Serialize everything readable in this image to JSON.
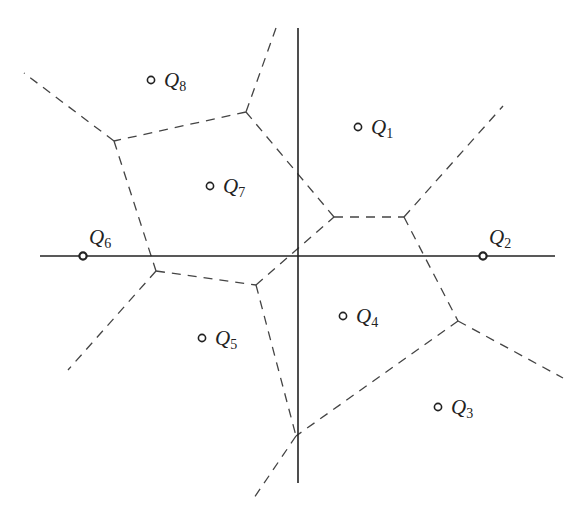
{
  "diagram": {
    "type": "voronoi",
    "axes": {
      "horizontal": {
        "x1": 40,
        "x2": 555,
        "y": 256
      },
      "vertical": {
        "x": 298,
        "y1": 28,
        "y2": 483
      }
    },
    "sites": [
      {
        "id": "Q1",
        "letter": "Q",
        "index": "1",
        "x": 358,
        "y": 127,
        "lx": 371,
        "ly": 134,
        "on_axis": false
      },
      {
        "id": "Q2",
        "letter": "Q",
        "index": "2",
        "x": 483,
        "y": 256,
        "lx": 489,
        "ly": 244,
        "on_axis": true
      },
      {
        "id": "Q3",
        "letter": "Q",
        "index": "3",
        "x": 438,
        "y": 407,
        "lx": 451,
        "ly": 414,
        "on_axis": false
      },
      {
        "id": "Q4",
        "letter": "Q",
        "index": "4",
        "x": 343,
        "y": 316,
        "lx": 356,
        "ly": 323,
        "on_axis": false
      },
      {
        "id": "Q5",
        "letter": "Q",
        "index": "5",
        "x": 202,
        "y": 338,
        "lx": 215,
        "ly": 345,
        "on_axis": false
      },
      {
        "id": "Q6",
        "letter": "Q",
        "index": "6",
        "x": 83,
        "y": 256,
        "lx": 89,
        "ly": 244,
        "on_axis": true
      },
      {
        "id": "Q7",
        "letter": "Q",
        "index": "7",
        "x": 210,
        "y": 186,
        "lx": 223,
        "ly": 193,
        "on_axis": false
      },
      {
        "id": "Q8",
        "letter": "Q",
        "index": "8",
        "x": 151,
        "y": 80,
        "lx": 164,
        "ly": 87,
        "on_axis": false
      }
    ],
    "vertices": {
      "A": [
        246,
        112
      ],
      "B": [
        114,
        141
      ],
      "C": [
        156,
        271
      ],
      "D": [
        256,
        285
      ],
      "E": [
        334,
        217
      ],
      "F": [
        404,
        217
      ],
      "G": [
        458,
        321
      ],
      "H": [
        296,
        436
      ]
    },
    "edges": [
      {
        "from": [
          276,
          28
        ],
        "to": [
          246,
          112
        ]
      },
      {
        "from": [
          246,
          112
        ],
        "to": [
          114,
          141
        ]
      },
      {
        "from": [
          114,
          141
        ],
        "to": [
          24,
          73
        ]
      },
      {
        "from": [
          246,
          112
        ],
        "to": [
          334,
          217
        ]
      },
      {
        "from": [
          114,
          141
        ],
        "to": [
          156,
          271
        ]
      },
      {
        "from": [
          156,
          271
        ],
        "to": [
          256,
          285
        ]
      },
      {
        "from": [
          156,
          271
        ],
        "to": [
          68,
          370
        ]
      },
      {
        "from": [
          256,
          285
        ],
        "to": [
          334,
          217
        ]
      },
      {
        "from": [
          334,
          217
        ],
        "to": [
          404,
          217
        ]
      },
      {
        "from": [
          404,
          217
        ],
        "to": [
          503,
          106
        ]
      },
      {
        "from": [
          404,
          217
        ],
        "to": [
          458,
          321
        ]
      },
      {
        "from": [
          458,
          321
        ],
        "to": [
          563,
          378
        ]
      },
      {
        "from": [
          458,
          321
        ],
        "to": [
          296,
          436
        ]
      },
      {
        "from": [
          256,
          285
        ],
        "to": [
          296,
          436
        ]
      },
      {
        "from": [
          296,
          436
        ],
        "to": [
          254,
          498
        ]
      }
    ],
    "colors": {
      "ink": "#222222",
      "dash": "#444444",
      "background": "#ffffff"
    }
  }
}
